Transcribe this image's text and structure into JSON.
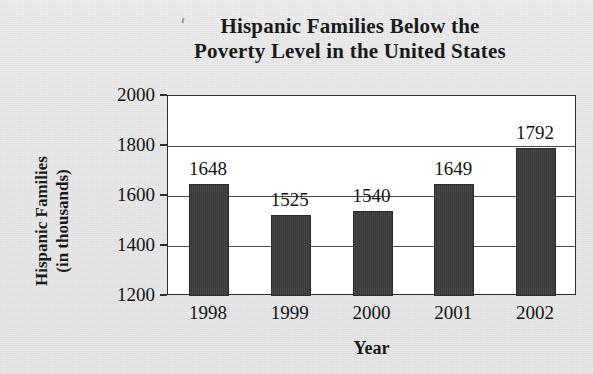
{
  "chart_data": {
    "type": "bar",
    "title": "Hispanic Families Below the Poverty Level in the United States",
    "title_lines": [
      "Hispanic Families Below the",
      "Poverty Level in the United States"
    ],
    "xlabel": "Year",
    "ylabel": "Hispanic Families (in thousands)",
    "ylabel_lines": [
      "Hispanic Families",
      "(in thousands)"
    ],
    "categories": [
      "1998",
      "1999",
      "2000",
      "2001",
      "2002"
    ],
    "values": [
      1648,
      1525,
      1540,
      1649,
      1792
    ],
    "value_labels": [
      "1648",
      "1525",
      "1540",
      "1649",
      "1792"
    ],
    "ylim": [
      1200,
      2000
    ],
    "yticks": [
      2000,
      1800,
      1600,
      1400,
      1200
    ],
    "ytick_labels": [
      "2000",
      "1800",
      "1600",
      "1400",
      "1200"
    ],
    "grid": true,
    "grid_axis": "y",
    "legend": null,
    "bar_color": "#3c3c3c",
    "plot_background": "#ffffff",
    "figure_background": "#e8e8e9",
    "axis_color": "#2e2e2e",
    "text_color": "#141414"
  }
}
